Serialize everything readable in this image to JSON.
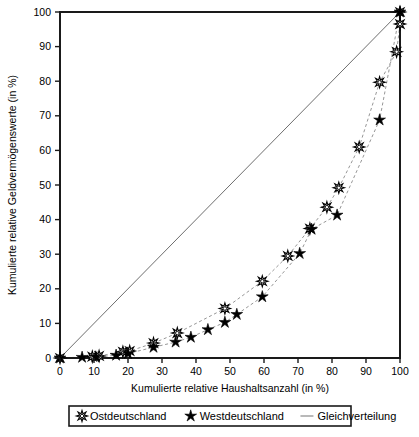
{
  "chart_data": {
    "type": "line",
    "title": "",
    "xlabel": "Kumulierte relative Haushaltsanzahl (in %)",
    "ylabel": "Kumulierte relative Geldvermögenswerte (in %)",
    "xlim": [
      0,
      100
    ],
    "ylim": [
      0,
      100
    ],
    "xticks": [
      0,
      10,
      20,
      30,
      40,
      50,
      60,
      70,
      80,
      90,
      100
    ],
    "yticks": [
      0,
      10,
      20,
      30,
      40,
      50,
      60,
      70,
      80,
      90,
      100
    ],
    "grid": false,
    "legend_position": "below-outside",
    "series": [
      {
        "name": "Ostdeutschland",
        "marker": "open-star",
        "line_style": "dashed",
        "points": [
          {
            "x": 0,
            "y": 0
          },
          {
            "x": 9.5,
            "y": 0.4
          },
          {
            "x": 11.5,
            "y": 0.6
          },
          {
            "x": 18.5,
            "y": 1.8
          },
          {
            "x": 20.5,
            "y": 2.0
          },
          {
            "x": 27.5,
            "y": 4.3
          },
          {
            "x": 34.5,
            "y": 7.2
          },
          {
            "x": 48.5,
            "y": 14.3
          },
          {
            "x": 59.5,
            "y": 22.2
          },
          {
            "x": 67.0,
            "y": 29.5
          },
          {
            "x": 73.5,
            "y": 37.4
          },
          {
            "x": 78.5,
            "y": 43.6
          },
          {
            "x": 82.0,
            "y": 49.2
          },
          {
            "x": 88.0,
            "y": 61.0
          },
          {
            "x": 94.0,
            "y": 79.7
          },
          {
            "x": 99.0,
            "y": 88.5
          },
          {
            "x": 100.0,
            "y": 96.5
          },
          {
            "x": 100.0,
            "y": 100.0
          }
        ]
      },
      {
        "name": "Westdeutschland",
        "marker": "filled-star",
        "line_style": "dashed",
        "points": [
          {
            "x": 0,
            "y": 0
          },
          {
            "x": 6.5,
            "y": 0.2
          },
          {
            "x": 10.5,
            "y": 0.3
          },
          {
            "x": 16.5,
            "y": 0.8
          },
          {
            "x": 20.0,
            "y": 1.3
          },
          {
            "x": 27.5,
            "y": 3.1
          },
          {
            "x": 34.0,
            "y": 4.6
          },
          {
            "x": 38.5,
            "y": 6.0
          },
          {
            "x": 43.5,
            "y": 8.2
          },
          {
            "x": 48.5,
            "y": 10.3
          },
          {
            "x": 52.0,
            "y": 12.6
          },
          {
            "x": 59.5,
            "y": 17.7
          },
          {
            "x": 70.5,
            "y": 30.2
          },
          {
            "x": 74.0,
            "y": 37.2
          },
          {
            "x": 81.5,
            "y": 41.3
          },
          {
            "x": 94.0,
            "y": 68.8
          },
          {
            "x": 100.0,
            "y": 100.0
          }
        ]
      },
      {
        "name": "Gleichverteilung",
        "marker": "none",
        "line_style": "solid",
        "points": [
          {
            "x": 0,
            "y": 0
          },
          {
            "x": 100,
            "y": 100
          }
        ]
      }
    ],
    "legend": [
      {
        "label": "Ostdeutschland",
        "marker": "open-star"
      },
      {
        "label": "Westdeutschland",
        "marker": "filled-star"
      },
      {
        "label": "Gleichverteilung",
        "marker": "line"
      }
    ]
  }
}
